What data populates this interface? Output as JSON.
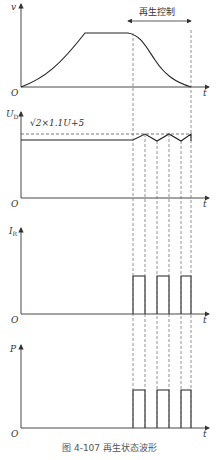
{
  "figure": {
    "caption": "图 4-107   再生状态波形",
    "annotation": "再生控制",
    "origin_label": "O",
    "time_label": "t"
  },
  "panels": [
    {
      "id": "velocity",
      "y_label": "v"
    },
    {
      "id": "dc-voltage",
      "y_label": "U",
      "y_label_sub": "D",
      "threshold_label": "√2×1.1U+5"
    },
    {
      "id": "resistor-current",
      "y_label": "I",
      "y_label_sub": "R"
    },
    {
      "id": "power",
      "y_label": "P"
    }
  ],
  "colors": {
    "line": "#333333",
    "dashed": "#555555",
    "background": "#ffffff"
  }
}
